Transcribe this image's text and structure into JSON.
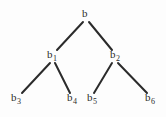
{
  "figure": {
    "type": "binary-tree-diagram",
    "width": 166,
    "height": 117,
    "background_color": "#fdfdfd",
    "edge_color": "#2b2b2b",
    "label_color": "#2b2b2b",
    "edge_width": 2
  },
  "nodes": [
    {
      "id": "root",
      "base": "b",
      "sub": "",
      "label": "b",
      "x": 85,
      "y": 15,
      "level": 0
    },
    {
      "id": "b1",
      "base": "b",
      "sub": "1",
      "label": "b1",
      "x": 52,
      "y": 56,
      "level": 1
    },
    {
      "id": "b2",
      "base": "b",
      "sub": "2",
      "label": "b2",
      "x": 115,
      "y": 56,
      "level": 1
    },
    {
      "id": "b3",
      "base": "b",
      "sub": "3",
      "label": "b3",
      "x": 16,
      "y": 99,
      "level": 2
    },
    {
      "id": "b4",
      "base": "b",
      "sub": "4",
      "label": "b4",
      "x": 72,
      "y": 99,
      "level": 2
    },
    {
      "id": "b5",
      "base": "b",
      "sub": "5",
      "label": "b5",
      "x": 92,
      "y": 99,
      "level": 2
    },
    {
      "id": "b6",
      "base": "b",
      "sub": "6",
      "label": "b6",
      "x": 150,
      "y": 99,
      "level": 2
    }
  ],
  "edges": [
    {
      "id": "root-b1",
      "from": "root",
      "to": "b1",
      "x1": 83,
      "y1": 22,
      "x2": 57,
      "y2": 50
    },
    {
      "id": "root-b2",
      "from": "root",
      "to": "b2",
      "x1": 89,
      "y1": 22,
      "x2": 112,
      "y2": 50
    },
    {
      "id": "b1-b3",
      "from": "b1",
      "to": "b3",
      "x1": 50,
      "y1": 63,
      "x2": 22,
      "y2": 93
    },
    {
      "id": "b1-b4",
      "from": "b1",
      "to": "b4",
      "x1": 55,
      "y1": 63,
      "x2": 70,
      "y2": 93
    },
    {
      "id": "b2-b5",
      "from": "b2",
      "to": "b5",
      "x1": 112,
      "y1": 63,
      "x2": 94,
      "y2": 93
    },
    {
      "id": "b2-b6",
      "from": "b2",
      "to": "b6",
      "x1": 118,
      "y1": 63,
      "x2": 147,
      "y2": 93
    }
  ]
}
